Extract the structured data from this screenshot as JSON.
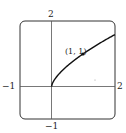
{
  "chart_data": {
    "type": "line",
    "title": "",
    "xlabel": "",
    "ylabel": "",
    "xlim": [
      -1,
      2
    ],
    "ylim": [
      -1,
      2
    ],
    "grid": false,
    "series": [
      {
        "name": "y = x^(2/3)",
        "x": [
          0,
          0.25,
          0.5,
          1,
          1.5,
          2
        ],
        "values": [
          0,
          0.397,
          0.63,
          1,
          1.31,
          1.587
        ]
      }
    ],
    "annotations": [
      {
        "text": "(1, 1)",
        "x": 1,
        "y": 1
      }
    ],
    "tick_labels": {
      "x_min": "−1",
      "x_max": "2",
      "y_min": "−1",
      "y_max": "2"
    }
  },
  "labels": {
    "y_top": "2",
    "y_bottom": "−1",
    "x_left": "−1",
    "x_right": "2",
    "point": "(1, 1)"
  }
}
